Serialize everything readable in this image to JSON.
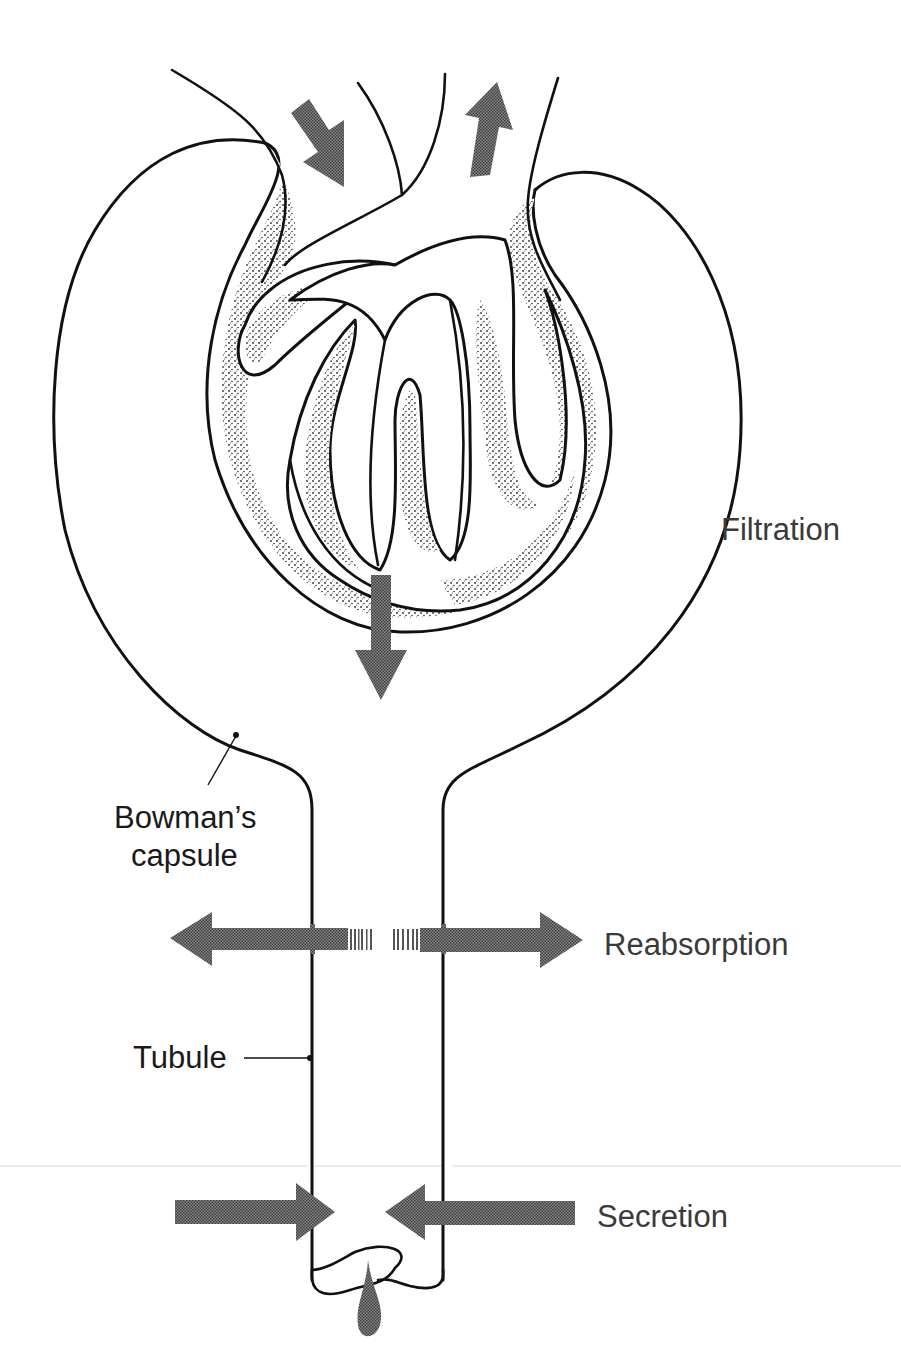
{
  "figure": {
    "colors": {
      "ink": "#111111",
      "arrow_fill": "#6e6e6e",
      "stipple": "#333333",
      "background": "#ffffff"
    }
  },
  "labels": {
    "filtration": "Filtration",
    "bowmans_line1": "Bowman’s",
    "bowmans_line2": "capsule",
    "reabsorption": "Reabsorption",
    "tubule": "Tubule",
    "secretion": "Secretion"
  },
  "arrows": [
    {
      "name": "afferent-inflow",
      "direction": "down-right"
    },
    {
      "name": "efferent-outflow",
      "direction": "up"
    },
    {
      "name": "filtration",
      "direction": "down"
    },
    {
      "name": "reabsorption",
      "direction": "left-and-right"
    },
    {
      "name": "secretion",
      "direction": "inward-from-both-sides"
    }
  ]
}
